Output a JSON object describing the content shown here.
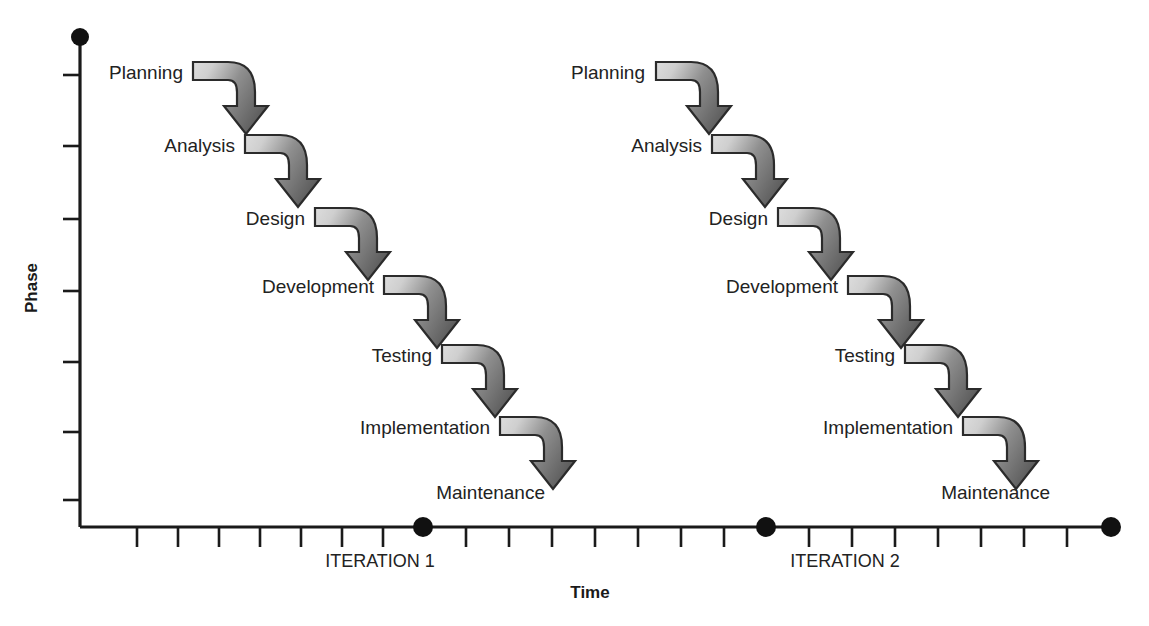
{
  "figure": {
    "type": "process-diagram",
    "title": "",
    "background_color": "#ffffff"
  },
  "axes": {
    "y_axis": {
      "label": "Phase",
      "label_rotated": true,
      "tick_count": 7,
      "origin_marker": "filled-circle"
    },
    "x_axis": {
      "label": "Time",
      "tick_count_per_segment": 7,
      "segment_markers": [
        "filled-circle",
        "filled-circle",
        "filled-circle"
      ]
    }
  },
  "segments": [
    {
      "label": "ITERATION 1"
    },
    {
      "label": "ITERATION 2"
    }
  ],
  "phases": [
    {
      "label": "Planning"
    },
    {
      "label": "Analysis"
    },
    {
      "label": "Design"
    },
    {
      "label": "Development"
    },
    {
      "label": "Testing"
    },
    {
      "label": "Implementation"
    },
    {
      "label": "Maintenance"
    }
  ],
  "iterations": [
    {
      "name": "ITERATION 1",
      "phases": [
        {
          "label": "Planning",
          "has_arrow": true
        },
        {
          "label": "Analysis",
          "has_arrow": true
        },
        {
          "label": "Design",
          "has_arrow": true
        },
        {
          "label": "Development",
          "has_arrow": true
        },
        {
          "label": "Testing",
          "has_arrow": true
        },
        {
          "label": "Implementation",
          "has_arrow": true
        },
        {
          "label": "Maintenance",
          "has_arrow": false
        }
      ]
    },
    {
      "name": "ITERATION 2",
      "phases": [
        {
          "label": "Planning",
          "has_arrow": true
        },
        {
          "label": "Analysis",
          "has_arrow": true
        },
        {
          "label": "Design",
          "has_arrow": true
        },
        {
          "label": "Development",
          "has_arrow": true
        },
        {
          "label": "Testing",
          "has_arrow": true
        },
        {
          "label": "Implementation",
          "has_arrow": true
        },
        {
          "label": "Maintenance",
          "has_arrow": false
        }
      ]
    }
  ],
  "colors": {
    "ink": "#1a1a1a",
    "text": "#222222",
    "arrow_outline": "#2b2b2b",
    "arrow_light": "#d8d8d8",
    "arrow_dark": "#636363"
  },
  "geometry": {
    "y_axis_x": 80,
    "y_axis_top": 37,
    "x_axis_y": 527,
    "x_axis_right": 1113,
    "iteration1_dot_x": 423,
    "iteration2_dot_x": 766,
    "row_step": 57,
    "first_row_y": 74,
    "iter1_first_label_x": 183,
    "iter2_first_label_x": 645,
    "col_step": 52
  }
}
